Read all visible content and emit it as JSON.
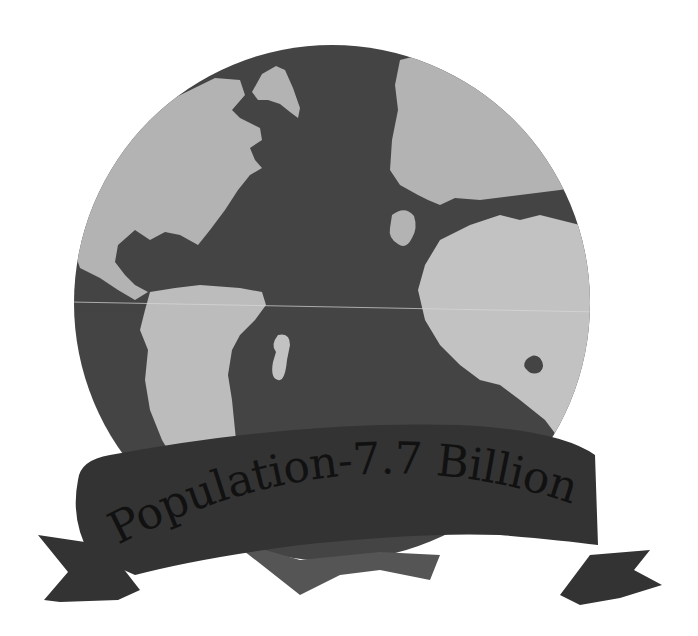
{
  "illustration": {
    "subject": "globe-with-ribbon-banner",
    "banner": {
      "text": "Population-7.7 Billion"
    },
    "colors": {
      "background": "#ffffff",
      "ocean": "#444444",
      "land": "#b3b3b3",
      "land_light": "#c2c2c2",
      "banner": "#333333",
      "banner_fold": "#555555",
      "text": "#111111"
    }
  }
}
